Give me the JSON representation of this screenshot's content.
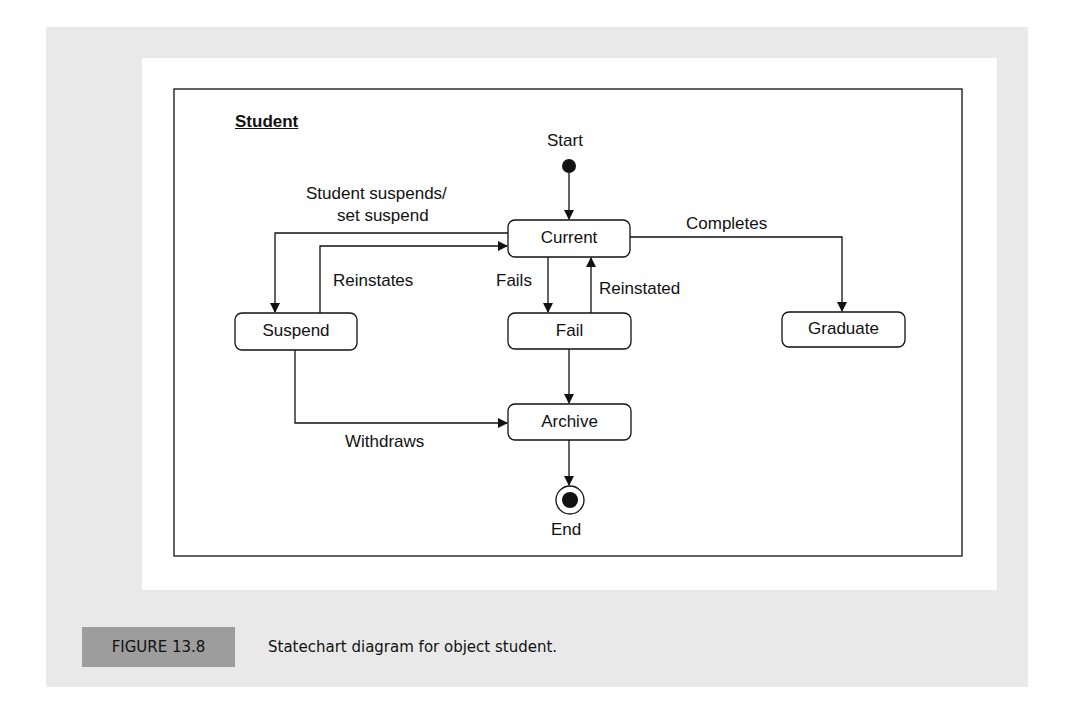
{
  "diagram": {
    "type": "statechart",
    "object_title": "Student",
    "pseudo_states": {
      "start": "Start",
      "end": "End"
    },
    "states": [
      {
        "id": "current",
        "label": "Current"
      },
      {
        "id": "suspend",
        "label": "Suspend"
      },
      {
        "id": "fail",
        "label": "Fail"
      },
      {
        "id": "graduate",
        "label": "Graduate"
      },
      {
        "id": "archive",
        "label": "Archive"
      }
    ],
    "transitions": [
      {
        "from": "start",
        "to": "current",
        "label": ""
      },
      {
        "from": "current",
        "to": "suspend",
        "label_line1": "Student suspends/",
        "label_line2": "set suspend"
      },
      {
        "from": "suspend",
        "to": "current",
        "label": "Reinstates"
      },
      {
        "from": "current",
        "to": "fail",
        "label": "Fails"
      },
      {
        "from": "fail",
        "to": "current",
        "label": "Reinstated"
      },
      {
        "from": "current",
        "to": "graduate",
        "label": "Completes"
      },
      {
        "from": "fail",
        "to": "archive",
        "label": ""
      },
      {
        "from": "suspend",
        "to": "archive",
        "label": "Withdraws"
      },
      {
        "from": "archive",
        "to": "end",
        "label": ""
      }
    ]
  },
  "caption": {
    "figure_number": "FIGURE 13.8",
    "text": "Statechart diagram for object student."
  },
  "colors": {
    "panel_bg": "#e9e9e9",
    "label_box": "#9d9d9d",
    "ink": "#111111"
  }
}
